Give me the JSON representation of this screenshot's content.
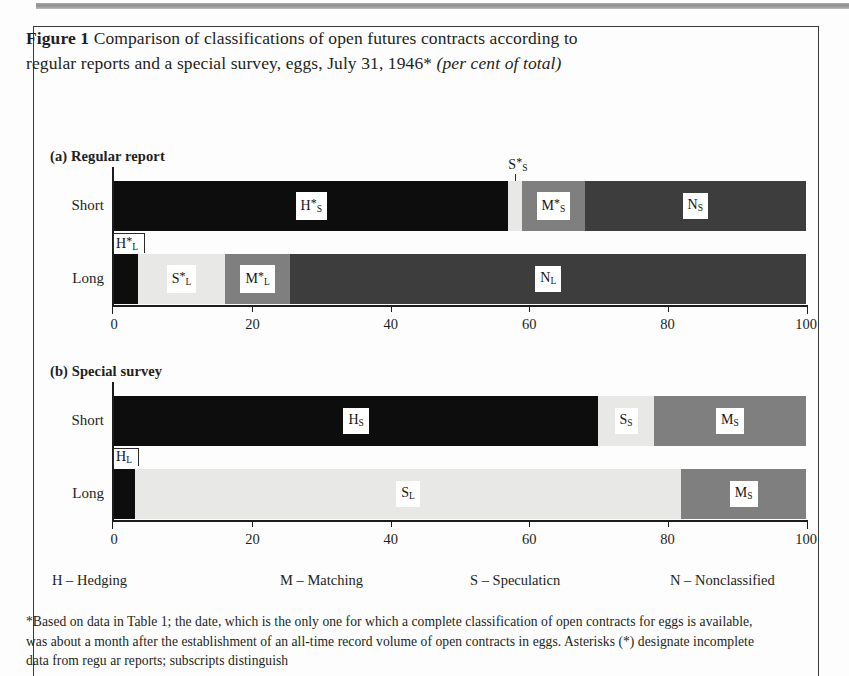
{
  "figure": {
    "number": "Figure 1",
    "title_line1": "Comparison of classifications of open futures contracts according to",
    "title_line2": "regular reports and a special survey, eggs, July 31, 1946*",
    "title_italic": "(per cent of total)"
  },
  "panels": [
    {
      "label": "(a) Regular report"
    },
    {
      "label": "(b) Special survey"
    }
  ],
  "rows": {
    "short": "Short",
    "long": "Long"
  },
  "axis": {
    "min": 0,
    "max": 100,
    "ticks": [
      0,
      20,
      40,
      60,
      80,
      100
    ],
    "tick_labels": [
      "0",
      "20",
      "40",
      "60",
      "80",
      "100"
    ]
  },
  "legend": [
    {
      "key": "H",
      "dash": "–",
      "text": "Hedging",
      "name": "legend-hedging"
    },
    {
      "key": "M",
      "dash": "–",
      "text": "Matching",
      "name": "legend-matching"
    },
    {
      "key": "S",
      "dash": "–",
      "text": "Speculaticn",
      "name": "legend-speculation"
    },
    {
      "key": "N",
      "dash": "–",
      "text": "Nonclassified",
      "name": "legend-nonclassified"
    }
  ],
  "colors": {
    "hedging": "#0d0d0d",
    "speculation": "#e8e8e6",
    "matching": "#7f7f7f",
    "nonclassified": "#3d3d3d",
    "axis": "#1c1c1c",
    "text": "#231f20",
    "page": "#fdfdfd"
  },
  "footnote": {
    "line1": "*Based on data in Table 1; the date, which is the only one for which a complete classification of open",
    "line2": "contracts for eggs is available, was about a month after the establishment of an all-time record volume of",
    "line3": "open contracts in eggs. Asterisks (*) designate incomplete data from regu ar reports; subscripts distinguish"
  },
  "chart_data": {
    "type": "bar",
    "title": "Comparison of classifications of open futures contracts according to regular reports and a special survey, eggs, July 31, 1946* (per cent of total)",
    "xlabel": "",
    "ylabel": "",
    "xlim": [
      0,
      100
    ],
    "grid": false,
    "orientation": "horizontal",
    "stacked": true,
    "legend_position": "below",
    "panels": [
      {
        "name": "(a) Regular report",
        "bars": [
          {
            "category": "Short",
            "segments": [
              {
                "label": "H*_S",
                "display": "H",
                "sub": "S",
                "star": true,
                "class": "hedging",
                "start": 0,
                "end": 57,
                "value": 57.0,
                "label_inside": true,
                "color": "#0d0d0d"
              },
              {
                "label": "S*_S",
                "display": "S",
                "sub": "S",
                "star": true,
                "class": "speculation",
                "start": 57,
                "end": 59,
                "value": 2.0,
                "label_inside": false,
                "color": "#e8e8e6"
              },
              {
                "label": "M*_S",
                "display": "M",
                "sub": "S",
                "star": true,
                "class": "matching",
                "start": 59,
                "end": 68,
                "value": 9.0,
                "label_inside": true,
                "color": "#7f7f7f"
              },
              {
                "label": "N_S",
                "display": "N",
                "sub": "S",
                "star": false,
                "class": "nonclassified",
                "start": 68,
                "end": 100,
                "value": 32.0,
                "label_inside": true,
                "color": "#3d3d3d"
              }
            ]
          },
          {
            "category": "Long",
            "segments": [
              {
                "label": "H*_L",
                "display": "H",
                "sub": "L",
                "star": true,
                "class": "hedging",
                "start": 0,
                "end": 3.5,
                "value": 3.5,
                "label_inside": false,
                "color": "#0d0d0d"
              },
              {
                "label": "S*_L",
                "display": "S",
                "sub": "L",
                "star": true,
                "class": "speculation",
                "start": 3.5,
                "end": 16,
                "value": 12.5,
                "label_inside": true,
                "color": "#e8e8e6"
              },
              {
                "label": "M*_L",
                "display": "M",
                "sub": "L",
                "star": true,
                "class": "matching",
                "start": 16,
                "end": 25.5,
                "value": 9.5,
                "label_inside": true,
                "color": "#7f7f7f"
              },
              {
                "label": "N_L",
                "display": "N",
                "sub": "L",
                "star": false,
                "class": "nonclassified",
                "start": 25.5,
                "end": 100,
                "value": 74.5,
                "label_inside": true,
                "color": "#3d3d3d"
              }
            ]
          }
        ]
      },
      {
        "name": "(b) Special survey",
        "bars": [
          {
            "category": "Short",
            "segments": [
              {
                "label": "H_S",
                "display": "H",
                "sub": "S",
                "star": false,
                "class": "hedging",
                "start": 0,
                "end": 70,
                "value": 70.0,
                "label_inside": true,
                "color": "#0d0d0d"
              },
              {
                "label": "S_S",
                "display": "S",
                "sub": "S",
                "star": false,
                "class": "speculation",
                "start": 70,
                "end": 78,
                "value": 8.0,
                "label_inside": true,
                "color": "#e8e8e6"
              },
              {
                "label": "M_S",
                "display": "M",
                "sub": "S",
                "star": false,
                "class": "matching",
                "start": 78,
                "end": 100,
                "value": 22.0,
                "label_inside": true,
                "color": "#7f7f7f"
              }
            ]
          },
          {
            "category": "Long",
            "segments": [
              {
                "label": "H_L",
                "display": "H",
                "sub": "L",
                "star": false,
                "class": "hedging",
                "start": 0,
                "end": 3,
                "value": 3.0,
                "label_inside": false,
                "color": "#0d0d0d"
              },
              {
                "label": "S_L",
                "display": "S",
                "sub": "L",
                "star": false,
                "class": "speculation",
                "start": 3,
                "end": 82,
                "value": 79.0,
                "label_inside": true,
                "color": "#e8e8e6"
              },
              {
                "label": "M_S",
                "display": "M",
                "sub": "S",
                "star": false,
                "class": "matching",
                "start": 82,
                "end": 100,
                "value": 18.0,
                "label_inside": true,
                "color": "#7f7f7f"
              }
            ]
          }
        ]
      }
    ]
  }
}
